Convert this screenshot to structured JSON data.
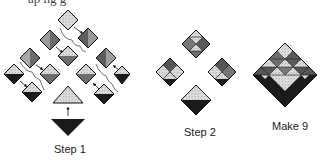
{
  "header": {
    "cut_text": "ap ng g"
  },
  "labels": {
    "step1": "Step 1",
    "step2": "Step 2",
    "make9": "Make 9"
  },
  "colors": {
    "black": "#1a1a1a",
    "dark_gray": "#6e6e6e",
    "mid_gray": "#9a9a9a",
    "light_speckle": "#d8d8d8",
    "outline": "#111111"
  }
}
